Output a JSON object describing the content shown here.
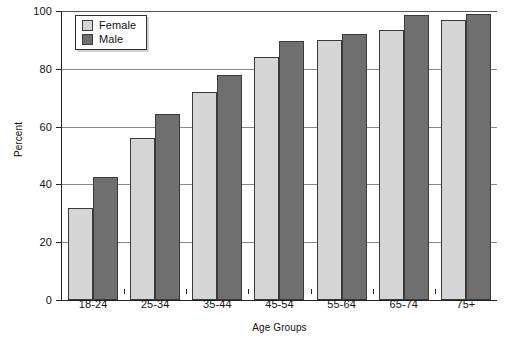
{
  "chart_data": {
    "type": "bar",
    "title": "",
    "subtitle": "",
    "xlabel": "Age Groups",
    "ylabel": "Percent",
    "categories": [
      "18-24",
      "25-34",
      "35-44",
      "45-54",
      "55-64",
      "65-74",
      "75+"
    ],
    "series": [
      {
        "name": "Female",
        "color": "#d5d5d5",
        "values": [
          32,
          56,
          72,
          84,
          90,
          93.5,
          97
        ]
      },
      {
        "name": "Male",
        "color": "#6f6f6f",
        "values": [
          42.5,
          64.5,
          78,
          89.5,
          92,
          98.5,
          99
        ]
      }
    ],
    "ylim": [
      0,
      100
    ],
    "yticks": [
      0,
      20,
      40,
      60,
      80,
      100
    ],
    "ytick_labels": [
      "0",
      "20",
      "40",
      "60",
      "80",
      "100"
    ],
    "grid": "horizontal",
    "legend_position": "top-left",
    "legend_entries": [
      "Female",
      "Male"
    ]
  }
}
